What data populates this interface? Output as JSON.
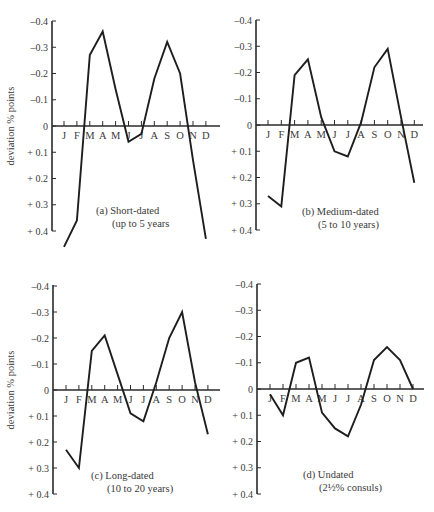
{
  "figure": {
    "ylabel": "deviation % points",
    "months": [
      "J",
      "F",
      "M",
      "A",
      "M",
      "J",
      "J",
      "A",
      "S",
      "O",
      "N",
      "D"
    ],
    "y_ticks": [
      {
        "value": -0.4,
        "label": "–0.4"
      },
      {
        "value": -0.3,
        "label": "–0.3"
      },
      {
        "value": -0.2,
        "label": "–0.2"
      },
      {
        "value": -0.1,
        "label": "–0.1"
      },
      {
        "value": 0,
        "label": "0"
      },
      {
        "value": 0.1,
        "label": "+ 0.1"
      },
      {
        "value": 0.2,
        "label": "+ 0.2"
      },
      {
        "value": 0.3,
        "label": "+ 0.3"
      },
      {
        "value": 0.4,
        "label": "+ 0.4"
      }
    ]
  },
  "chart_data": [
    {
      "type": "line",
      "panel": "a",
      "caption_line1": "(a)  Short-dated",
      "caption_line2": "(up to 5 years",
      "xlabel": "",
      "ylabel": "deviation % points",
      "ylim": [
        -0.4,
        0.4
      ],
      "y_inverted": true,
      "categories": [
        "J",
        "F",
        "M",
        "A",
        "M",
        "J",
        "J",
        "A",
        "S",
        "O",
        "N",
        "D"
      ],
      "values": [
        0.46,
        0.36,
        -0.27,
        -0.36,
        -0.14,
        0.06,
        0.03,
        -0.18,
        -0.32,
        -0.2,
        0.13,
        0.43
      ],
      "grid": false
    },
    {
      "type": "line",
      "panel": "b",
      "caption_line1": "(b)  Medium-dated",
      "caption_line2": "(5 to 10 years)",
      "xlabel": "",
      "ylabel": "",
      "ylim": [
        -0.4,
        0.4
      ],
      "y_inverted": true,
      "categories": [
        "J",
        "F",
        "M",
        "A",
        "M",
        "J",
        "J",
        "A",
        "S",
        "O",
        "N",
        "D"
      ],
      "values": [
        0.27,
        0.31,
        -0.19,
        -0.25,
        -0.03,
        0.1,
        0.12,
        -0.01,
        -0.22,
        -0.29,
        -0.03,
        0.22
      ],
      "grid": false
    },
    {
      "type": "line",
      "panel": "c",
      "caption_line1": "(c)  Long-dated",
      "caption_line2": "(10 to 20 years)",
      "xlabel": "",
      "ylabel": "deviation % points",
      "ylim": [
        -0.4,
        0.4
      ],
      "y_inverted": true,
      "categories": [
        "J",
        "F",
        "M",
        "A",
        "M",
        "J",
        "J",
        "A",
        "S",
        "O",
        "N",
        "D"
      ],
      "values": [
        0.23,
        0.3,
        -0.15,
        -0.21,
        -0.06,
        0.09,
        0.12,
        -0.03,
        -0.2,
        -0.3,
        -0.03,
        0.17
      ],
      "grid": false
    },
    {
      "type": "line",
      "panel": "d",
      "caption_line1": "(d)  Undated",
      "caption_line2": "(2½% consuls)",
      "xlabel": "",
      "ylabel": "",
      "ylim": [
        -0.4,
        0.4
      ],
      "y_inverted": true,
      "categories": [
        "J",
        "F",
        "M",
        "A",
        "M",
        "J",
        "J",
        "A",
        "S",
        "O",
        "N",
        "D"
      ],
      "values": [
        0.02,
        0.1,
        -0.1,
        -0.12,
        0.09,
        0.15,
        0.18,
        0.06,
        -0.11,
        -0.16,
        -0.11,
        0.0
      ],
      "grid": false
    }
  ],
  "layout": {
    "panels": [
      {
        "axis_x": 52,
        "zero_y": 126,
        "top_y": 21,
        "bottom_y": 231,
        "first_tick_x": 64,
        "tick_step": 12.9,
        "axis_end_x": 220,
        "show_ylabel": true,
        "caption_x": 96,
        "caption_y": 214
      },
      {
        "axis_x": 256,
        "zero_y": 125,
        "top_y": 20,
        "bottom_y": 230,
        "first_tick_x": 268,
        "tick_step": 13.3,
        "axis_end_x": 423,
        "show_ylabel": false,
        "caption_x": 302,
        "caption_y": 215
      },
      {
        "axis_x": 53,
        "zero_y": 390,
        "top_y": 285,
        "bottom_y": 494,
        "first_tick_x": 66,
        "tick_step": 12.9,
        "axis_end_x": 220,
        "show_ylabel": true,
        "caption_x": 91,
        "caption_y": 479
      },
      {
        "axis_x": 257,
        "zero_y": 389,
        "top_y": 284,
        "bottom_y": 494,
        "first_tick_x": 270,
        "tick_step": 13.0,
        "axis_end_x": 424,
        "show_ylabel": false,
        "caption_x": 303,
        "caption_y": 478
      }
    ]
  }
}
